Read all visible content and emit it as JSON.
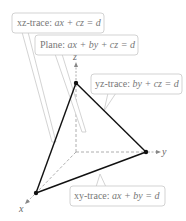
{
  "diagram": {
    "axes": {
      "x": "x",
      "y": "y",
      "z": "z"
    },
    "callouts": [
      {
        "id": "xz-trace",
        "prefix": "xz-trace:",
        "equation": "ax + cz = d"
      },
      {
        "id": "plane",
        "prefix": "Plane:",
        "equation": "ax + by + cz = d"
      },
      {
        "id": "yz-trace",
        "prefix": "yz-trace:",
        "equation": "by + cz = d"
      },
      {
        "id": "xy-trace",
        "prefix": "xy-trace:",
        "equation": "ax + by = d"
      }
    ],
    "colors": {
      "edges": "#111111",
      "axes": "#888888",
      "callout_border": "#c8c8c8",
      "text": "#777777"
    }
  }
}
